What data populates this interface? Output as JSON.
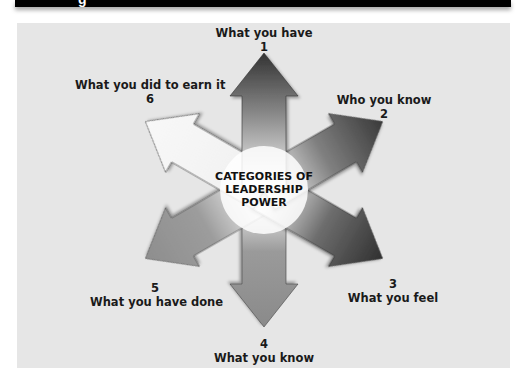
{
  "banner": {
    "partial_glyph": "g"
  },
  "diagram": {
    "title": "CATEGORIES OF LEADERSHIP POWER",
    "center_lines": [
      "CATEGORIES OF",
      "LEADERSHIP",
      "POWER"
    ],
    "categories": [
      {
        "number": "1",
        "label": "What you have"
      },
      {
        "number": "2",
        "label": "Who you know"
      },
      {
        "number": "3",
        "label": "What you feel"
      },
      {
        "number": "4",
        "label": "What you know"
      },
      {
        "number": "5",
        "label": "What you have done"
      },
      {
        "number": "6",
        "label": "What you did to earn it"
      }
    ]
  },
  "colors": {
    "panel": "#e6e6e6",
    "arrow_dark": "#3a3a3a",
    "arrow_mid": "#8c8c8c",
    "arrow_light": "#f4f4f4",
    "banner": "#000000"
  }
}
